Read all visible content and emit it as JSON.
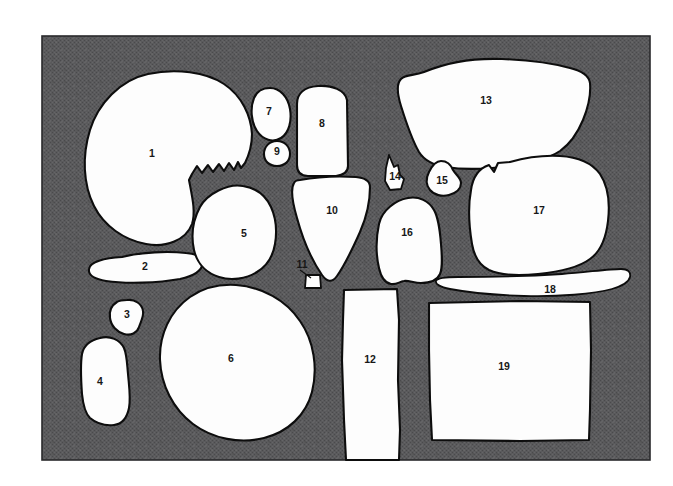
{
  "figure": {
    "kind": "artifact-plate",
    "background_color": "#ffffff",
    "panel_color": "#58585a",
    "panel_texture": "dither-halftone",
    "shape_fill_color": "#fdfdfd",
    "shape_outline_color": "#0d0d0d",
    "label_color": "#171717",
    "panel": {
      "x": 42,
      "y": 36,
      "width": 608,
      "height": 424
    },
    "item_count": 19
  },
  "items": [
    {
      "id": "1",
      "label": "1",
      "label_x": 152,
      "label_y": 154,
      "description": "large-rounded-skull-like-shape-with-serrated-right-edge"
    },
    {
      "id": "2",
      "label": "2",
      "label_x": 145,
      "label_y": 267,
      "description": "elongated-horizontal-sliver"
    },
    {
      "id": "3",
      "label": "3",
      "label_x": 127,
      "label_y": 315,
      "description": "small-irregular-blob"
    },
    {
      "id": "4",
      "label": "4",
      "label_x": 100,
      "label_y": 382,
      "description": "tall-irregular-fragment"
    },
    {
      "id": "5",
      "label": "5",
      "label_x": 244,
      "label_y": 234,
      "description": "rounded-polygon"
    },
    {
      "id": "6",
      "label": "6",
      "label_x": 231,
      "label_y": 359,
      "description": "large-irregular-circle"
    },
    {
      "id": "7",
      "label": "7",
      "label_x": 269,
      "label_y": 112,
      "description": "small-oval"
    },
    {
      "id": "8",
      "label": "8",
      "label_x": 322,
      "label_y": 124,
      "description": "rounded-rectangle-tablet"
    },
    {
      "id": "9",
      "label": "9",
      "label_x": 277,
      "label_y": 152,
      "description": "tiny-oval"
    },
    {
      "id": "10",
      "label": "10",
      "label_x": 332,
      "label_y": 211,
      "description": "downward-tapering-triangle"
    },
    {
      "id": "11",
      "label": "11",
      "label_x": 302,
      "label_y": 265,
      "description": "tiny-square-with-leader-line"
    },
    {
      "id": "12",
      "label": "12",
      "label_x": 370,
      "label_y": 360,
      "description": "tall-vertical-rectangle"
    },
    {
      "id": "13",
      "label": "13",
      "label_x": 486,
      "label_y": 101,
      "description": "large-wide-irregular-polygon"
    },
    {
      "id": "14",
      "label": "14",
      "label_x": 395,
      "label_y": 177,
      "description": "narrow-pointed-spike"
    },
    {
      "id": "15",
      "label": "15",
      "label_x": 442,
      "label_y": 181,
      "description": "small-angular-blob"
    },
    {
      "id": "16",
      "label": "16",
      "label_x": 407,
      "label_y": 233,
      "description": "medium-irregular-blob"
    },
    {
      "id": "17",
      "label": "17",
      "label_x": 539,
      "label_y": 211,
      "description": "large-rounded-blob"
    },
    {
      "id": "18",
      "label": "18",
      "label_x": 550,
      "label_y": 290,
      "description": "long-thin-tapering-sliver"
    },
    {
      "id": "19",
      "label": "19",
      "label_x": 504,
      "label_y": 367,
      "description": "large-rectangle-slab"
    }
  ]
}
